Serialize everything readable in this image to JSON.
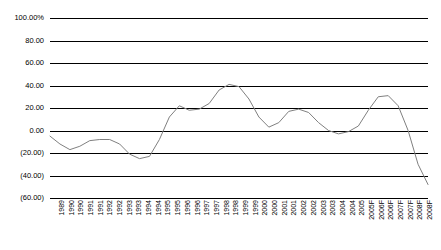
{
  "chart_data": {
    "type": "line",
    "title": "",
    "xlabel": "",
    "ylabel": "",
    "ylim": [
      -60,
      100
    ],
    "ytick_labels": [
      "100.00%",
      "80.00",
      "60.00",
      "40.00",
      "20.00",
      "0.00",
      "(20.00)",
      "(40.00)",
      "(60.00)"
    ],
    "ytick_values": [
      100,
      80,
      60,
      40,
      20,
      0,
      -20,
      -40,
      -60
    ],
    "grid": true,
    "legend": "none",
    "line_color": "#808080",
    "grid_color": "#000000",
    "categories": [
      "1989",
      "1990",
      "1990",
      "1991",
      "1991",
      "1992",
      "1992",
      "1993",
      "1993",
      "1994",
      "1994",
      "1995",
      "1995",
      "1996",
      "1996",
      "1997",
      "1997",
      "1998",
      "1998",
      "1999",
      "1999",
      "2000",
      "2000",
      "2001",
      "2001",
      "2002",
      "2002",
      "2003",
      "2003",
      "2004",
      "2004",
      "2005",
      "2005F",
      "2006F",
      "2006F",
      "2007F",
      "2007F",
      "2008F",
      "2008F"
    ],
    "values": [
      -5,
      -12,
      -17,
      -14,
      -9,
      -8,
      -12,
      -22,
      -25,
      -18,
      5,
      26,
      33,
      41,
      38,
      22,
      10,
      9,
      9,
      17,
      12,
      4,
      -2,
      -5,
      0,
      16,
      28,
      30,
      22,
      -2,
      -30,
      -50,
      -52,
      -28,
      10,
      18,
      22,
      20,
      22
    ],
    "series": [
      {
        "name": "growth-rate",
        "values": [
          -5,
          -12,
          -17,
          -14,
          -9,
          -8,
          -12,
          -22,
          -25,
          -18,
          5,
          26,
          33,
          41,
          38,
          22,
          10,
          9,
          9,
          17,
          12,
          4,
          -2,
          -5,
          0,
          16,
          28,
          30,
          22,
          -2,
          -30,
          -50,
          -52,
          -28,
          10,
          18,
          22,
          20,
          22
        ]
      }
    ],
    "points": [
      {
        "x": 0.0,
        "label": "1989",
        "y": -5
      },
      {
        "x": 1.0,
        "label": "1990",
        "y": -12
      },
      {
        "x": 1.6,
        "label": "1990",
        "y": -17
      },
      {
        "x": 2.6,
        "label": "1991",
        "y": -13
      },
      {
        "x": 3.4,
        "label": "1991",
        "y": -9
      },
      {
        "x": 4.2,
        "label": "1992",
        "y": -8
      },
      {
        "x": 5.0,
        "label": "1992",
        "y": -10
      },
      {
        "x": 5.8,
        "label": "1993",
        "y": -19
      },
      {
        "x": 6.4,
        "label": "1993",
        "y": -25
      },
      {
        "x": 7.0,
        "label": "1994",
        "y": -24
      },
      {
        "x": 7.8,
        "label": "1994",
        "y": -8
      },
      {
        "x": 8.6,
        "label": "1995",
        "y": 12
      },
      {
        "x": 9.2,
        "label": "1995",
        "y": 22
      },
      {
        "x": 9.8,
        "label": "1996",
        "y": 18
      },
      {
        "x": 10.4,
        "label": "1996",
        "y": 18
      },
      {
        "x": 11.2,
        "label": "1997",
        "y": 22
      },
      {
        "x": 12.0,
        "label": "1997",
        "y": 34
      },
      {
        "x": 12.8,
        "label": "1998",
        "y": 41
      },
      {
        "x": 13.6,
        "label": "1998",
        "y": 40
      },
      {
        "x": 14.4,
        "label": "1999",
        "y": 30
      },
      {
        "x": 15.2,
        "label": "1999",
        "y": 12
      },
      {
        "x": 16.0,
        "label": "2000",
        "y": 4
      },
      {
        "x": 16.8,
        "label": "2000",
        "y": 8
      },
      {
        "x": 17.6,
        "label": "2001",
        "y": 18
      },
      {
        "x": 18.4,
        "label": "2001",
        "y": 20
      },
      {
        "x": 19.2,
        "label": "2002",
        "y": 17
      },
      {
        "x": 20.0,
        "label": "2002",
        "y": 8
      },
      {
        "x": 20.8,
        "label": "2003",
        "y": 0
      },
      {
        "x": 21.6,
        "label": "2003",
        "y": -3
      },
      {
        "x": 22.4,
        "label": "2004",
        "y": 0
      },
      {
        "x": 23.2,
        "label": "2004",
        "y": 4
      },
      {
        "x": 24.0,
        "label": "2005",
        "y": 18
      },
      {
        "x": 24.8,
        "label": "2005F",
        "y": 30
      },
      {
        "x": 25.6,
        "label": "2006F",
        "y": 31
      },
      {
        "x": 26.4,
        "label": "2006F",
        "y": 22
      },
      {
        "x": 27.2,
        "label": "2007F",
        "y": 0
      },
      {
        "x": 28.0,
        "label": "2007F",
        "y": -30
      },
      {
        "x": 28.8,
        "label": "2008F",
        "y": -48
      },
      {
        "x": 29.4,
        "label": "2008F",
        "y": -52
      }
    ],
    "annotations": [
      {
        "text": "peak",
        "value": 76,
        "near": "2003-2004"
      },
      {
        "text": "trough",
        "value": -52,
        "near": "2001"
      }
    ]
  },
  "xtick_labels": [
    "1989",
    "1990",
    "1990",
    "1991",
    "1991",
    "1992",
    "1992",
    "1993",
    "1993",
    "1994",
    "1994",
    "1995",
    "1995",
    "1996",
    "1996",
    "1997",
    "1997",
    "1998",
    "1998",
    "1999",
    "1999",
    "2000",
    "2000",
    "2001",
    "2001",
    "2002",
    "2002",
    "2003",
    "2003",
    "2004",
    "2004",
    "2005",
    "2005F",
    "2006F",
    "2006F",
    "2007F",
    "2007F",
    "2008F",
    "2008F"
  ],
  "series_path": [
    {
      "i": 0,
      "v": -5
    },
    {
      "i": 1,
      "v": -12
    },
    {
      "i": 2,
      "v": -17
    },
    {
      "i": 3,
      "v": -14
    },
    {
      "i": 4,
      "v": -9
    },
    {
      "i": 5,
      "v": -8
    },
    {
      "i": 6,
      "v": -8
    },
    {
      "i": 7,
      "v": -12
    },
    {
      "i": 8,
      "v": -21
    },
    {
      "i": 9,
      "v": -25
    },
    {
      "i": 10,
      "v": -23
    },
    {
      "i": 11,
      "v": -8
    },
    {
      "i": 12,
      "v": 12
    },
    {
      "i": 13,
      "v": 22
    },
    {
      "i": 14,
      "v": 18
    },
    {
      "i": 15,
      "v": 19
    },
    {
      "i": 16,
      "v": 24
    },
    {
      "i": 17,
      "v": 36
    },
    {
      "i": 18,
      "v": 41
    },
    {
      "i": 19,
      "v": 39
    },
    {
      "i": 20,
      "v": 28
    },
    {
      "i": 21,
      "v": 12
    },
    {
      "i": 22,
      "v": 3
    },
    {
      "i": 23,
      "v": 7
    },
    {
      "i": 24,
      "v": 17
    },
    {
      "i": 25,
      "v": 19
    },
    {
      "i": 26,
      "v": 16
    },
    {
      "i": 27,
      "v": 7
    },
    {
      "i": 28,
      "v": 0
    },
    {
      "i": 29,
      "v": -3
    },
    {
      "i": 30,
      "v": -1
    },
    {
      "i": 31,
      "v": 4
    },
    {
      "i": 32,
      "v": 18
    },
    {
      "i": 33,
      "v": 30
    },
    {
      "i": 34,
      "v": 31
    },
    {
      "i": 35,
      "v": 22
    },
    {
      "i": 36,
      "v": 0
    },
    {
      "i": 37,
      "v": -30
    },
    {
      "i": 38,
      "v": -48
    }
  ]
}
